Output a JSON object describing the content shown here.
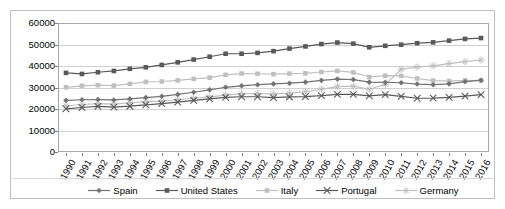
{
  "chart_data": {
    "type": "line",
    "title": "",
    "subtitle": "",
    "xlabel": "",
    "ylabel": "",
    "ylim": [
      0,
      60000
    ],
    "yticks": [
      0,
      10000,
      20000,
      30000,
      40000,
      50000,
      60000
    ],
    "grid": true,
    "legend_position": "bottom",
    "x": [
      1990,
      1991,
      1992,
      1993,
      1994,
      1995,
      1996,
      1997,
      1998,
      1999,
      2000,
      2001,
      2002,
      2003,
      2004,
      2005,
      2006,
      2007,
      2008,
      2009,
      2010,
      2011,
      2012,
      2013,
      2014,
      2015,
      2016
    ],
    "series": [
      {
        "name": "Spain",
        "color": "#737373",
        "marker": "diamond",
        "values": [
          24000,
          24300,
          24400,
          24200,
          24700,
          25300,
          25900,
          26800,
          27800,
          28900,
          30100,
          30800,
          31300,
          31700,
          32000,
          32500,
          33300,
          33900,
          33700,
          32500,
          32400,
          32200,
          31600,
          31300,
          31700,
          32700,
          33400
        ]
      },
      {
        "name": "United States",
        "color": "#595959",
        "marker": "square",
        "values": [
          36800,
          36300,
          37100,
          37700,
          38700,
          39400,
          40500,
          41700,
          43000,
          44300,
          45700,
          45700,
          46100,
          46900,
          48100,
          49100,
          50200,
          50900,
          50400,
          48700,
          49400,
          49900,
          50600,
          51000,
          51800,
          52600,
          53000
        ]
      },
      {
        "name": "Italy",
        "color": "#bfbfbf",
        "marker": "square",
        "values": [
          30100,
          30800,
          31100,
          30900,
          31700,
          32600,
          32800,
          33300,
          34000,
          34600,
          35900,
          36500,
          36400,
          36200,
          36500,
          36600,
          37200,
          37700,
          37000,
          34900,
          35500,
          35400,
          34200,
          33200,
          33000,
          33300,
          33200
        ]
      },
      {
        "name": "Portugal",
        "color": "#595959",
        "marker": "x",
        "values": [
          20100,
          20700,
          21200,
          20900,
          21300,
          21900,
          22500,
          23200,
          24000,
          24700,
          25400,
          25700,
          25700,
          25300,
          25600,
          25800,
          26200,
          26800,
          26800,
          26100,
          26700,
          25900,
          25000,
          25100,
          25400,
          26000,
          26700
        ]
      },
      {
        "name": "Germany",
        "color": "#bfbfbf",
        "marker": "asterisk",
        "values": [
          21400,
          22100,
          22500,
          22300,
          22900,
          23400,
          23700,
          24300,
          25000,
          25600,
          26500,
          27100,
          27200,
          27000,
          27400,
          28000,
          29200,
          30400,
          30600,
          29200,
          31400,
          38500,
          39500,
          40100,
          41100,
          42000,
          42800
        ]
      }
    ]
  },
  "legend": {
    "items": [
      {
        "label": "Spain"
      },
      {
        "label": "United States"
      },
      {
        "label": "Italy"
      },
      {
        "label": "Portugal"
      },
      {
        "label": "Germany"
      }
    ]
  }
}
